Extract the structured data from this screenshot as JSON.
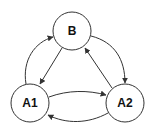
{
  "diagram": {
    "type": "state-graph",
    "nodes": [
      {
        "id": "B",
        "label": "B",
        "cx": 72,
        "cy": 31,
        "r": 19
      },
      {
        "id": "A1",
        "label": "A1",
        "cx": 30,
        "cy": 103,
        "r": 19
      },
      {
        "id": "A2",
        "label": "A2",
        "cx": 125,
        "cy": 103,
        "r": 19
      }
    ],
    "edges": [
      {
        "from": "A1",
        "to": "B"
      },
      {
        "from": "B",
        "to": "A1"
      },
      {
        "from": "B",
        "to": "A2"
      },
      {
        "from": "A2",
        "to": "B"
      },
      {
        "from": "A1",
        "to": "A2"
      },
      {
        "from": "A2",
        "to": "A1"
      }
    ],
    "colors": {
      "stroke": "#333333",
      "fill": "#ffffff",
      "text": "#111111"
    }
  }
}
